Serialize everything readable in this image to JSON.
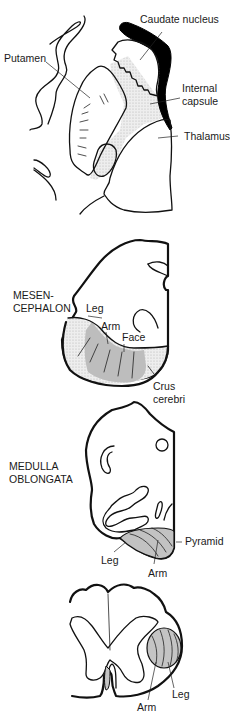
{
  "figure": {
    "colors": {
      "tract_fill": "#c4c4c4",
      "capsule_fill": "#e3e3e3",
      "caudate_fill": "#000000",
      "outline": "#111111"
    }
  },
  "panels": {
    "forebrain": {
      "labels": {
        "caudate": "Caudate nucleus",
        "putamen": "Putamen",
        "internal_line1": "Internal",
        "internal_line2": "capsule",
        "thalamus": "Thalamus"
      }
    },
    "mesencephalon": {
      "section_line1": "MESEN-",
      "section_line2": "CEPHALON",
      "labels": {
        "leg": "Leg",
        "arm": "Arm",
        "face": "Face",
        "crus_line1": "Crus",
        "crus_line2": "cerebri"
      }
    },
    "medulla": {
      "section_line1": "MEDULLA",
      "section_line2": "OBLONGATA",
      "labels": {
        "pyramid": "Pyramid",
        "leg": "Leg",
        "arm": "Arm"
      }
    },
    "spinal_cord": {
      "labels": {
        "leg": "Leg",
        "arm": "Arm"
      }
    }
  }
}
